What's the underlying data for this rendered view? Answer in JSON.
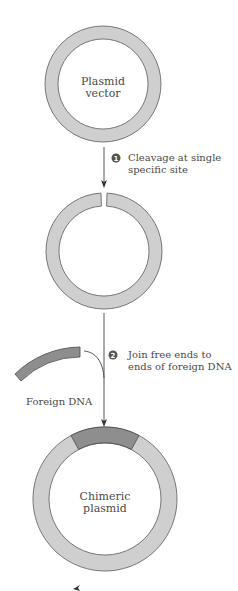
{
  "diagram": {
    "type": "process-flow",
    "colors": {
      "ring_fill": "#cfcfcf",
      "ring_stroke": "#5a5a5a",
      "foreign_dna_fill": "#8e8e8e",
      "text": "#4a4a4a",
      "badge": "#555555"
    },
    "stages": [
      {
        "id": "plasmid-vector",
        "label_line1": "Plasmid",
        "label_line2": "vector"
      },
      {
        "id": "cleaved-plasmid",
        "label_line1": "",
        "label_line2": ""
      },
      {
        "id": "chimeric-plasmid",
        "label_line1": "Chimeric",
        "label_line2": "plasmid"
      }
    ],
    "steps": [
      {
        "number": "1",
        "line1": "Cleavage at single",
        "line2": "specific site"
      },
      {
        "number": "2",
        "line1": "Join free ends to",
        "line2": "ends of foreign DNA"
      }
    ],
    "foreign_dna": {
      "label": "Foreign DNA"
    }
  }
}
